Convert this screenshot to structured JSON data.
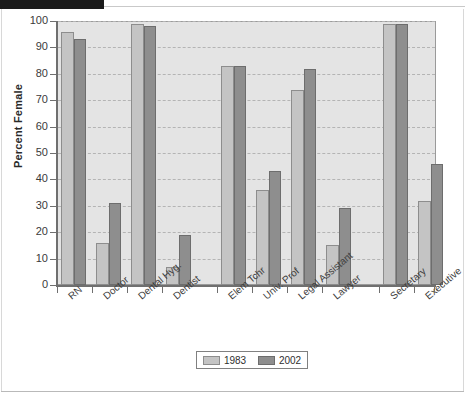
{
  "chart_data": {
    "type": "bar",
    "title": "",
    "xlabel": "",
    "ylabel": "Percent Female",
    "ylim": [
      0,
      100
    ],
    "ytick_step": 10,
    "yticks": [
      0,
      10,
      20,
      30,
      40,
      50,
      60,
      70,
      80,
      90,
      100
    ],
    "grid": true,
    "legend_position": "bottom-center",
    "categories": [
      "RN",
      "Doctor",
      "Dental Hyg.",
      "Dentist",
      "Elem Tchr",
      "Univ. Prof",
      "Legal Assistant",
      "Lawyer",
      "Secretary",
      "Executive"
    ],
    "series": [
      {
        "name": "1983",
        "color": "#c4c4c4",
        "values": [
          96,
          16,
          99,
          7,
          83,
          36,
          74,
          15,
          99,
          32
        ]
      },
      {
        "name": "2002",
        "color": "#8e8e8e",
        "values": [
          93,
          31,
          98,
          19,
          83,
          43,
          82,
          29,
          99,
          46
        ]
      }
    ]
  },
  "legend": {
    "items": [
      {
        "label": "1983"
      },
      {
        "label": "2002"
      }
    ]
  },
  "caption": {
    "text": ""
  }
}
